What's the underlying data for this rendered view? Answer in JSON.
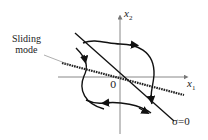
{
  "diagram": {
    "annotation": {
      "line1": "Sliding",
      "line2": "mode"
    },
    "axes": {
      "x_label": "x",
      "x_sub": "1",
      "y_label": "x",
      "y_sub": "2",
      "origin": "0"
    },
    "switching_line_label": "σ=0",
    "colors": {
      "curve": "#111111",
      "axis": "#888888",
      "text": "#222222"
    }
  }
}
